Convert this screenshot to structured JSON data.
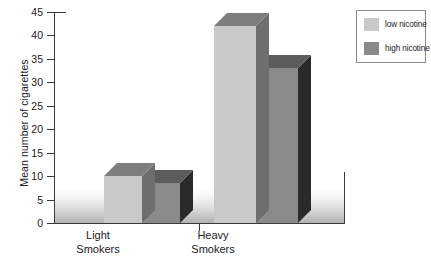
{
  "chart_data": {
    "type": "bar",
    "title": "",
    "subtitle": "",
    "xlabel": "",
    "ylabel": "Mean number of cigarettes",
    "categories": [
      "Light\nSmokers",
      "Heavy\nSmokers"
    ],
    "category_labels": [
      {
        "line1": "Light",
        "line2": "Smokers"
      },
      {
        "line1": "Heavy",
        "line2": "Smokers"
      }
    ],
    "series": [
      {
        "name": "low nicotine",
        "values": [
          10,
          42
        ],
        "color": "#c9c9c9"
      },
      {
        "name": "high nicotine",
        "values": [
          8.5,
          33
        ],
        "color": "#8a8a8a"
      }
    ],
    "ylim": [
      0,
      45
    ],
    "yticks": [
      0,
      5,
      10,
      15,
      20,
      25,
      30,
      35,
      40,
      45
    ],
    "ytick_labels": [
      "0",
      "5",
      "10",
      "15",
      "20",
      "25",
      "30",
      "35",
      "40",
      "45"
    ],
    "grid": false,
    "legend_position": "top-right",
    "legend": [
      {
        "label": "low nicotine",
        "color": "#c9c9c9"
      },
      {
        "label": "high nicotine",
        "color": "#8a8a8a"
      }
    ],
    "style": "3d-bar"
  },
  "colors": {
    "low_nicotine_front": "#c9c9c9",
    "low_nicotine_top": "#7e7e7e",
    "low_nicotine_side": "#6e6e6e",
    "high_nicotine_front": "#8a8a8a",
    "high_nicotine_top": "#5c5c5c",
    "high_nicotine_side": "#2a2a2a",
    "axis": "#3a3a3a",
    "background": "#ffffff",
    "legend_border": "#8a8a8a"
  }
}
